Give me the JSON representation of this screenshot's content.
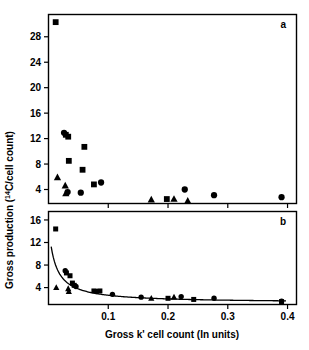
{
  "figure": {
    "xlabel": "Gross k' cell count (In units)",
    "ylabel_main": "Gross production (",
    "ylabel_sup": "14",
    "ylabel_tail": "C/cell count)",
    "ylabel_full": "Gross production (14C/cell count)"
  },
  "chart_data": [
    {
      "type": "scatter",
      "panel": "a",
      "title": "",
      "xlabel": "Gross k' cell count (In units)",
      "ylabel": "Gross production (14C/cell count)",
      "xlim": [
        0.0,
        0.415
      ],
      "ylim": [
        1.8,
        31.5
      ],
      "xticks": [
        0.1,
        0.2,
        0.3,
        0.4
      ],
      "xticklabels": [
        "0.1",
        "0.2",
        "0.3",
        "0.4"
      ],
      "yticks": [
        4,
        8,
        12,
        16,
        20,
        24,
        28
      ],
      "yticklabels": [
        "4",
        "8",
        "12",
        "16",
        "20",
        "24",
        "28"
      ],
      "grid": false,
      "legend": "none",
      "series": [
        {
          "name": "squares",
          "marker": "square",
          "points": [
            {
              "x": 0.012,
              "y": 30.3
            },
            {
              "x": 0.029,
              "y": 12.6
            },
            {
              "x": 0.033,
              "y": 12.3
            },
            {
              "x": 0.034,
              "y": 8.5
            },
            {
              "x": 0.06,
              "y": 10.7
            },
            {
              "x": 0.057,
              "y": 7.1
            },
            {
              "x": 0.076,
              "y": 4.8
            },
            {
              "x": 0.198,
              "y": 2.5
            }
          ]
        },
        {
          "name": "circles",
          "marker": "circle",
          "points": [
            {
              "x": 0.026,
              "y": 12.9
            },
            {
              "x": 0.032,
              "y": 3.6
            },
            {
              "x": 0.054,
              "y": 3.5
            },
            {
              "x": 0.088,
              "y": 5.1
            },
            {
              "x": 0.228,
              "y": 4.0
            },
            {
              "x": 0.277,
              "y": 3.1
            },
            {
              "x": 0.39,
              "y": 2.8
            }
          ]
        },
        {
          "name": "triangles",
          "marker": "triangle",
          "points": [
            {
              "x": 0.015,
              "y": 5.9
            },
            {
              "x": 0.028,
              "y": 4.6
            },
            {
              "x": 0.029,
              "y": 3.4
            },
            {
              "x": 0.172,
              "y": 2.4
            },
            {
              "x": 0.21,
              "y": 2.5
            },
            {
              "x": 0.233,
              "y": 2.2
            }
          ]
        }
      ]
    },
    {
      "type": "scatter",
      "panel": "b",
      "title": "",
      "xlabel": "Gross k' cell count (In units)",
      "ylabel": "Gross production (14C/cell count)",
      "xlim": [
        0.0,
        0.415
      ],
      "ylim": [
        1.0,
        17.5
      ],
      "xticks": [
        0.1,
        0.2,
        0.3,
        0.4
      ],
      "xticklabels": [
        "0.1",
        "0.2",
        "0.3",
        "0.4"
      ],
      "yticks": [
        4,
        8,
        12,
        16
      ],
      "yticklabels": [
        "4",
        "8",
        "12",
        "16"
      ],
      "grid": false,
      "legend": "none",
      "fit_curve": {
        "form": "hyperbolic",
        "description": "declining hyperbolic fit through all points"
      },
      "series": [
        {
          "name": "squares",
          "marker": "square",
          "points": [
            {
              "x": 0.012,
              "y": 14.4
            },
            {
              "x": 0.03,
              "y": 6.6
            },
            {
              "x": 0.036,
              "y": 6.1
            },
            {
              "x": 0.04,
              "y": 4.8
            },
            {
              "x": 0.043,
              "y": 4.4
            },
            {
              "x": 0.076,
              "y": 3.4
            },
            {
              "x": 0.086,
              "y": 3.4
            },
            {
              "x": 0.2,
              "y": 2.1
            },
            {
              "x": 0.243,
              "y": 1.9
            },
            {
              "x": 0.39,
              "y": 1.5
            }
          ]
        },
        {
          "name": "circles",
          "marker": "circle",
          "points": [
            {
              "x": 0.028,
              "y": 7.0
            },
            {
              "x": 0.046,
              "y": 4.2
            },
            {
              "x": 0.081,
              "y": 3.3
            },
            {
              "x": 0.107,
              "y": 2.8
            },
            {
              "x": 0.155,
              "y": 2.3
            },
            {
              "x": 0.222,
              "y": 2.4
            },
            {
              "x": 0.277,
              "y": 2.1
            },
            {
              "x": 0.39,
              "y": 1.6
            }
          ]
        },
        {
          "name": "triangles",
          "marker": "triangle",
          "points": [
            {
              "x": 0.013,
              "y": 4.0
            },
            {
              "x": 0.033,
              "y": 3.8
            },
            {
              "x": 0.034,
              "y": 3.3
            },
            {
              "x": 0.172,
              "y": 2.1
            },
            {
              "x": 0.21,
              "y": 2.3
            }
          ]
        }
      ]
    }
  ],
  "panels": {
    "a": {
      "label": "a"
    },
    "b": {
      "label": "b"
    }
  }
}
